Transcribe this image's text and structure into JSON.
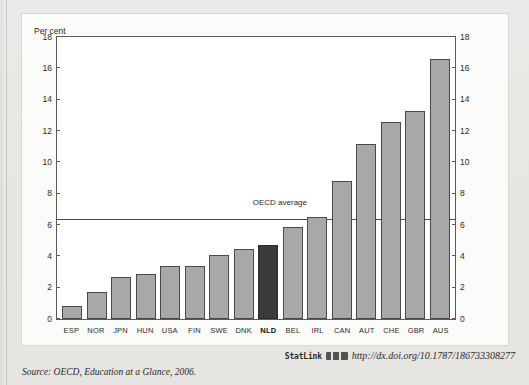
{
  "document": {
    "running_title": "",
    "source_line": "Source:  OECD, Education at a Glance, 2006."
  },
  "statlink": {
    "label": "StatLink",
    "icon": "statlink-barcode-icon",
    "url": "http://dx.doi.org/10.1787/186733308277"
  },
  "colors": {
    "bar": "#a8a8a8",
    "bar_highlight": "#3a3a3a",
    "axis": "#5a5a5a",
    "panel": "#fbfbfa",
    "page": "#e9e8e6"
  },
  "chart_data": {
    "type": "bar",
    "title": "",
    "xlabel": "",
    "ylabel": "Per cent",
    "ylim": [
      0,
      18
    ],
    "yticks": [
      0,
      2,
      4,
      6,
      8,
      10,
      12,
      14,
      16,
      18
    ],
    "grid": false,
    "legend": "none",
    "dual_axis": true,
    "categories": [
      "ESP",
      "NOR",
      "JPN",
      "HUN",
      "USA",
      "FIN",
      "SWE",
      "DNK",
      "NLD",
      "BEL",
      "IRL",
      "CAN",
      "AUT",
      "CHE",
      "GBR",
      "AUS"
    ],
    "values": [
      0.8,
      1.7,
      2.7,
      2.85,
      3.4,
      3.4,
      4.1,
      4.45,
      4.75,
      5.9,
      6.5,
      8.8,
      11.2,
      12.6,
      13.3,
      16.6
    ],
    "highlighted_category": "NLD",
    "annotations": [
      {
        "name": "oecd-average",
        "label": "OECD average",
        "value": 6.35,
        "type": "horizontal-reference-line"
      }
    ]
  }
}
